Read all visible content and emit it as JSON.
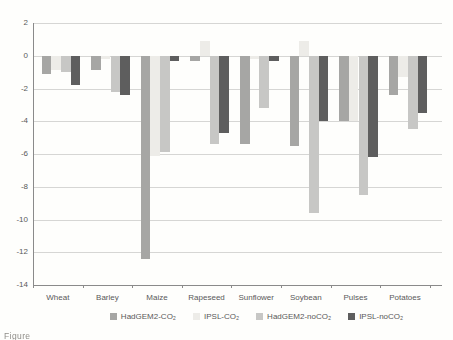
{
  "figure": {
    "caption_fragment": "Figure"
  },
  "chart_data": {
    "type": "bar",
    "title": "",
    "xlabel": "",
    "ylabel": "",
    "grid": "horizontal",
    "legend_position": "bottom",
    "categories": [
      "Wheat",
      "Barley",
      "Maize",
      "Rapeseed",
      "Sunflower",
      "Soybean",
      "Pulses",
      "Potatoes"
    ],
    "series": [
      {
        "name": "HadGEM2-CO₂",
        "color": "#a6a6a4",
        "values": [
          -1.1,
          -0.9,
          -12.4,
          -0.3,
          -5.4,
          -5.5,
          -4.0,
          -2.4
        ]
      },
      {
        "name": "IPSL-CO₂",
        "color": "#edece8",
        "values": [
          -0.9,
          -0.2,
          -6.1,
          0.9,
          -0.2,
          0.9,
          -4.0,
          -1.3
        ]
      },
      {
        "name": "HadGEM2-noCO₂",
        "color": "#c7c7c5",
        "values": [
          -1.0,
          -2.2,
          -5.9,
          -5.4,
          -3.2,
          -9.6,
          -8.5,
          -4.5
        ]
      },
      {
        "name": "IPSL-noCO₂",
        "color": "#5e5e5e",
        "values": [
          -1.8,
          -2.4,
          -0.3,
          -4.7,
          -0.3,
          -4.0,
          -6.2,
          -3.5
        ]
      }
    ],
    "ylim": [
      -14,
      2
    ],
    "y_ticks": [
      2,
      0,
      -2,
      -4,
      -6,
      -8,
      -10,
      -12,
      -14
    ]
  }
}
